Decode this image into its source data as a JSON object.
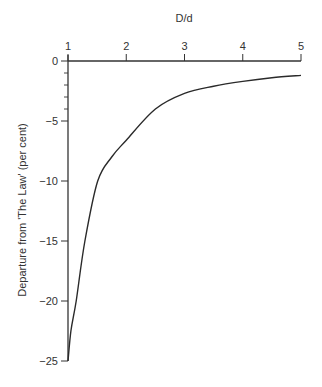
{
  "chart_data": {
    "type": "line",
    "title": "",
    "xlabel": "D/d",
    "ylabel": "Departure from 'The Law' (per cent)",
    "xlim": [
      1,
      5
    ],
    "ylim": [
      -25,
      0
    ],
    "x_ticks": [
      1,
      2,
      3,
      4,
      5
    ],
    "x_tick_labels": [
      "1",
      "2",
      "3",
      "4",
      "5"
    ],
    "y_ticks": [
      0,
      -5,
      -10,
      -15,
      -20,
      -25
    ],
    "y_tick_labels": [
      "0",
      "−5",
      "−10",
      "−15",
      "−20",
      "−25"
    ],
    "y_minor_ticks": [
      -1,
      -2,
      -3,
      -4
    ],
    "x_axis_position": "top",
    "grid": false,
    "legend": null,
    "series": [
      {
        "name": "Departure",
        "x": [
          1.0,
          1.05,
          1.14,
          1.29,
          1.51,
          1.75,
          2.0,
          2.5,
          3.0,
          3.5,
          4.0,
          4.5,
          5.0
        ],
        "values": [
          -25,
          -22.5,
          -20,
          -15,
          -10,
          -8,
          -6.6,
          -4.0,
          -2.7,
          -2.1,
          -1.7,
          -1.4,
          -1.2
        ]
      }
    ]
  }
}
